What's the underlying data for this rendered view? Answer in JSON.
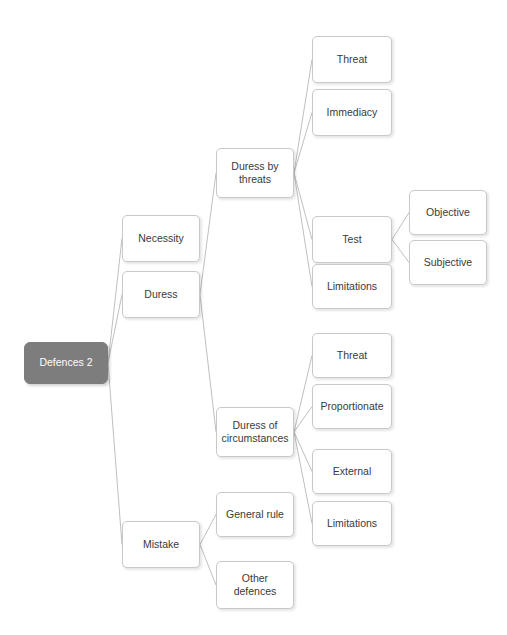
{
  "diagram": {
    "title": "Defences 2",
    "type": "hierarchical-tree",
    "background_color": "#ffffff",
    "root_fill_color": "#7d7d7d",
    "root_text_color": "#ffffff",
    "node_fill_color": "#ffffff",
    "node_border_color": "#c9c9c9",
    "node_text_color": "#3a3a3a",
    "connector_color": "#b8b8b8"
  },
  "nodes": [
    {
      "id": "root",
      "label": "Defences 2",
      "x": 24,
      "y": 342,
      "w": 84,
      "h": 42,
      "style": "root",
      "parent": null
    },
    {
      "id": "necessity",
      "label": "Necessity",
      "x": 122,
      "y": 215,
      "w": 78,
      "h": 47,
      "style": "plain",
      "parent": "root"
    },
    {
      "id": "duress",
      "label": "Duress",
      "x": 122,
      "y": 271,
      "w": 78,
      "h": 47,
      "style": "plain",
      "parent": "root"
    },
    {
      "id": "mistake",
      "label": "Mistake",
      "x": 122,
      "y": 521,
      "w": 78,
      "h": 47,
      "style": "plain",
      "parent": "root"
    },
    {
      "id": "duress-threats",
      "label": "Duress by\nthreats",
      "x": 216,
      "y": 148,
      "w": 78,
      "h": 50,
      "style": "plain",
      "parent": "duress"
    },
    {
      "id": "duress-circ",
      "label": "Duress of\ncircumstances",
      "x": 216,
      "y": 407,
      "w": 78,
      "h": 50,
      "style": "plain",
      "parent": "duress"
    },
    {
      "id": "dbt-threat",
      "label": "Threat",
      "x": 312,
      "y": 36,
      "w": 80,
      "h": 47,
      "style": "plain",
      "parent": "duress-threats"
    },
    {
      "id": "dbt-immediacy",
      "label": "Immediacy",
      "x": 312,
      "y": 89,
      "w": 80,
      "h": 47,
      "style": "plain",
      "parent": "duress-threats"
    },
    {
      "id": "dbt-test",
      "label": "Test",
      "x": 312,
      "y": 216,
      "w": 80,
      "h": 47,
      "style": "plain",
      "parent": "duress-threats"
    },
    {
      "id": "dbt-limits",
      "label": "Limitations",
      "x": 312,
      "y": 264,
      "w": 80,
      "h": 45,
      "style": "plain",
      "parent": "duress-threats"
    },
    {
      "id": "test-objective",
      "label": "Objective",
      "x": 409,
      "y": 190,
      "w": 78,
      "h": 45,
      "style": "plain",
      "parent": "dbt-test"
    },
    {
      "id": "test-subjective",
      "label": "Subjective",
      "x": 409,
      "y": 240,
      "w": 78,
      "h": 45,
      "style": "plain",
      "parent": "dbt-test"
    },
    {
      "id": "doc-threat",
      "label": "Threat",
      "x": 312,
      "y": 333,
      "w": 80,
      "h": 45,
      "style": "plain",
      "parent": "duress-circ"
    },
    {
      "id": "doc-proportion",
      "label": "Proportionate",
      "x": 312,
      "y": 384,
      "w": 80,
      "h": 45,
      "style": "plain",
      "parent": "duress-circ"
    },
    {
      "id": "doc-external",
      "label": "External",
      "x": 312,
      "y": 449,
      "w": 80,
      "h": 45,
      "style": "plain",
      "parent": "duress-circ"
    },
    {
      "id": "doc-limits",
      "label": "Limitations",
      "x": 312,
      "y": 501,
      "w": 80,
      "h": 45,
      "style": "plain",
      "parent": "duress-circ"
    },
    {
      "id": "mis-general",
      "label": "General rule",
      "x": 216,
      "y": 492,
      "w": 78,
      "h": 45,
      "style": "plain",
      "parent": "mistake"
    },
    {
      "id": "mis-other",
      "label": "Other\ndefences",
      "x": 216,
      "y": 561,
      "w": 78,
      "h": 48,
      "style": "plain",
      "parent": "mistake"
    }
  ]
}
